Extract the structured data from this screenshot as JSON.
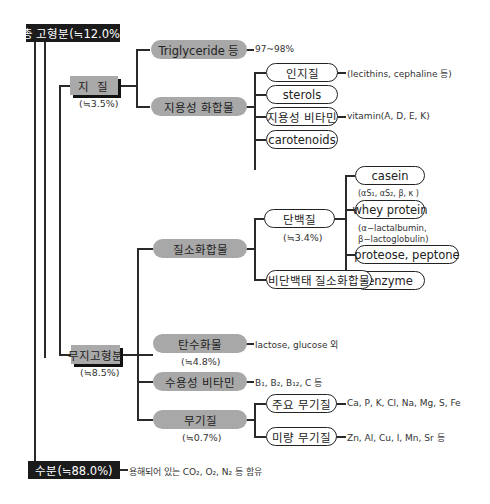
{
  "root": {
    "total_solids": "총 고형분(≒12.0%)",
    "water": "수분(≒88.0%)",
    "water_note": "용해되어 있는 CO₂, O₂, N₂ 등 함유"
  },
  "lipid": {
    "label": "지 질",
    "pct": "(≒3.5%)",
    "triglyceride": {
      "label": "Triglyceride 등",
      "note": "97~98%"
    },
    "lipid_compounds": {
      "label": "지용성 화합물",
      "items": [
        {
          "label": "인지질",
          "note": "(lecithins, cephaline 등)"
        },
        {
          "label": "sterols",
          "note": ""
        },
        {
          "label": "지용성 비타민",
          "note": "vitamin(A, D, E, K)"
        },
        {
          "label": "carotenoids",
          "note": ""
        }
      ]
    }
  },
  "snf": {
    "label": "무지고형분",
    "pct": "(≒8.5%)",
    "nitrogen": {
      "label": "질소화합물",
      "protein": {
        "label": "단백질",
        "pct": "(≒3.4%)",
        "items": [
          {
            "label": "casein",
            "note": "(αS₁, αS₂, β, κ )"
          },
          {
            "label": "whey protein",
            "note_line1": "(α−lactalbumin,",
            "note_line2": "β−lactoglobulin)"
          },
          {
            "label": "proteose, peptone"
          },
          {
            "label": "enzyme"
          }
        ]
      },
      "npn": {
        "label": "비단백태 질소화합물"
      }
    },
    "carbohydrate": {
      "label": "탄수화물",
      "pct": "(≒4.8%)",
      "note": "lactose, glucose 외"
    },
    "water_soluble_vitamin": {
      "label": "수용성 비타민",
      "note": "B₁, B₂, B₁₂, C 등"
    },
    "minerals": {
      "label": "무기질",
      "pct": "(≒0.7%)",
      "items": [
        {
          "label": "주요 무기질",
          "note": "Ca, P, K, Cl, Na, Mg, S, Fe"
        },
        {
          "label": "미량 무기질",
          "note": "Zn, Al, Cu, I, Mn, Sr 등"
        }
      ]
    }
  },
  "colors": {
    "dark_box": "#1b1b1b",
    "gray_fill": "#a9a9a9",
    "line": "#2a2a2a"
  }
}
